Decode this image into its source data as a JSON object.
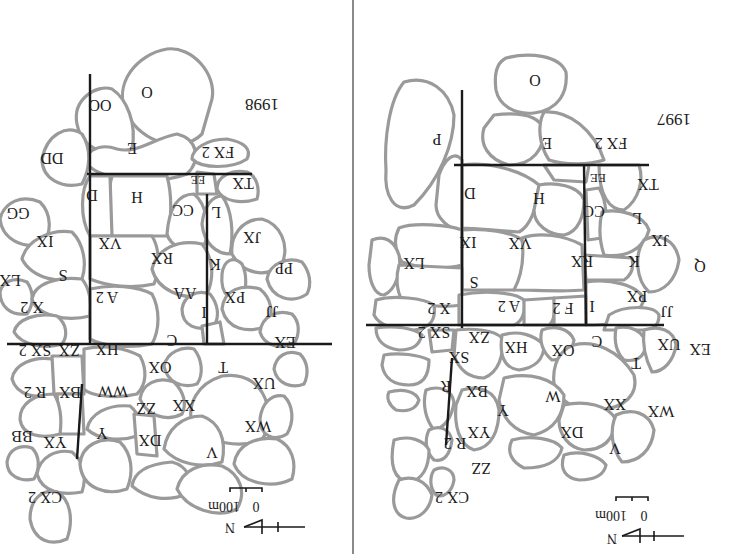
{
  "figure": {
    "orientation": "rotated 180 degrees",
    "colors": {
      "cell_border": "#9a9a9a",
      "axis_line": "#1a1a1a",
      "background": "#ffffff",
      "divider": "#8a8a8a"
    }
  },
  "panels": [
    {
      "id": "map-1998",
      "year": "1998",
      "scale": {
        "zero": "0",
        "length": "100m",
        "north": "N"
      },
      "territories": [
        "O",
        "OO",
        "E",
        "FX 2",
        "DD",
        "TX",
        "EE",
        "H",
        "D",
        "CC",
        "L",
        "GG",
        "JX",
        "IX",
        "VX",
        "RX",
        "K",
        "PP",
        "LX",
        "S",
        "AA",
        "PX",
        "X 2",
        "A 2",
        "JJ",
        "I",
        "EX",
        "C",
        "SX 2",
        "ZX",
        "HX",
        "OX",
        "T",
        "UX",
        "BX",
        "R 2",
        "WW",
        "ZZ",
        "XX",
        "WX",
        "BB",
        "YX",
        "Y",
        "DX",
        "V",
        "CX 2"
      ]
    },
    {
      "id": "map-1997",
      "year": "1997",
      "scale": {
        "zero": "0",
        "length": "100m",
        "north": "N"
      },
      "territories": [
        "O",
        "P",
        "E",
        "FX 2",
        "TX",
        "EE",
        "D",
        "H",
        "CC",
        "L",
        "JX",
        "IX",
        "VX",
        "RX",
        "K",
        "Q",
        "LX",
        "S",
        "PX",
        "X 2",
        "A 2",
        "F 2",
        "I",
        "JJ",
        "SX 2",
        "ZX",
        "HX",
        "OX",
        "C",
        "UX",
        "EX",
        "SX",
        "T",
        "R",
        "BX",
        "W",
        "Y",
        "XX",
        "WX",
        "YX",
        "DX",
        "R 2",
        "V",
        "ZZ",
        "CX 2"
      ]
    }
  ]
}
